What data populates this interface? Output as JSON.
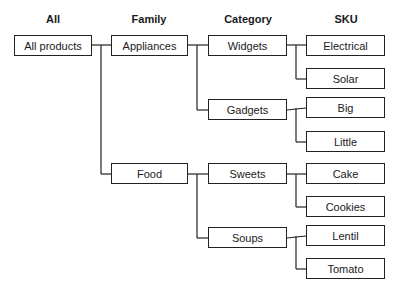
{
  "headers": [
    "All",
    "Family",
    "Category",
    "SKU"
  ],
  "nodes": {
    "all": "All products",
    "appliances": "Appliances",
    "food": "Food",
    "widgets": "Widgets",
    "gadgets": "Gadgets",
    "sweets": "Sweets",
    "soups": "Soups",
    "electrical": "Electrical",
    "solar": "Solar",
    "big": "Big",
    "little": "Little",
    "cake": "Cake",
    "cookies": "Cookies",
    "lentil": "Lentil",
    "tomato": "Tomato"
  },
  "hierarchy": {
    "All products": {
      "Appliances": {
        "Widgets": [
          "Electrical",
          "Solar"
        ],
        "Gadgets": [
          "Big",
          "Little"
        ]
      },
      "Food": {
        "Sweets": [
          "Cake",
          "Cookies"
        ],
        "Soups": [
          "Lentil",
          "Tomato"
        ]
      }
    }
  }
}
